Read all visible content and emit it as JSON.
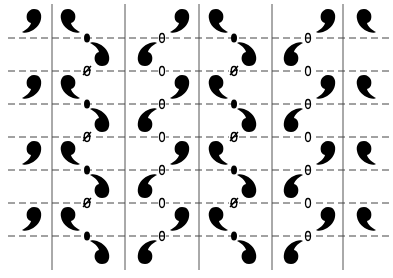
{
  "diagram": {
    "title": "",
    "colors": {
      "background": "#ffffff",
      "motif": "#000000",
      "grid_line": "#555555",
      "dashed_line": "#444444"
    },
    "canvas": {
      "width": 393,
      "height": 278
    },
    "vertical_lines": [
      {
        "x": 52,
        "y1": 4,
        "y2": 270
      },
      {
        "x": 125,
        "y1": 4,
        "y2": 270
      },
      {
        "x": 199,
        "y1": 4,
        "y2": 270
      },
      {
        "x": 272,
        "y1": 4,
        "y2": 270
      },
      {
        "x": 343,
        "y1": 4,
        "y2": 270
      }
    ],
    "dashed_lines": [
      {
        "y": 38
      },
      {
        "y": 71
      },
      {
        "y": 104
      },
      {
        "y": 137
      },
      {
        "y": 170
      },
      {
        "y": 203
      },
      {
        "y": 236
      }
    ],
    "dashed_x_range": [
      8,
      390
    ],
    "band_period": 66,
    "band_offsets": [
      0,
      66,
      132,
      198
    ],
    "motifs_per_band": [
      {
        "name": "motif-col1-upper",
        "type": "comma-head-up-tail-left",
        "x": 34,
        "y": 18,
        "flip": false
      },
      {
        "name": "motif-col2-upper",
        "type": "comma-head-up-tail-right",
        "x": 68,
        "y": 18,
        "flip": true
      },
      {
        "name": "motif-col2-lower",
        "type": "comma-head-down-tail-upleft",
        "x": 102,
        "y": 57,
        "rot": 180,
        "flip": true
      },
      {
        "name": "motif-col3-lower",
        "type": "comma-head-down-tail-upright",
        "x": 145,
        "y": 57,
        "rot": 180,
        "flip": false
      },
      {
        "name": "motif-col3-upper",
        "type": "comma-head-up-tail-left",
        "x": 182,
        "y": 18,
        "flip": false
      },
      {
        "name": "motif-col4-upper",
        "type": "comma-head-up-tail-right",
        "x": 216,
        "y": 18,
        "flip": true
      },
      {
        "name": "motif-col4-lower",
        "type": "comma-head-down-tail-upleft",
        "x": 249,
        "y": 57,
        "rot": 180,
        "flip": true
      },
      {
        "name": "motif-col5-lower",
        "type": "comma-head-down-tail-upright",
        "x": 291,
        "y": 57,
        "rot": 180,
        "flip": false
      },
      {
        "name": "motif-col5-upper",
        "type": "comma-head-up-tail-left",
        "x": 328,
        "y": 18,
        "flip": false
      },
      {
        "name": "motif-col6-upper",
        "type": "comma-head-up-tail-right",
        "x": 364,
        "y": 18,
        "flip": true
      }
    ],
    "symbols_per_band": [
      {
        "name": "twofold-axis-dot",
        "symbol": "filled-ellipse",
        "x": 87,
        "y": 38
      },
      {
        "name": "glide-symbol-slashed",
        "symbol": "Ø",
        "x": 87,
        "y": 71
      },
      {
        "name": "theta-symbol",
        "symbol": "θ",
        "x": 162,
        "y": 38
      },
      {
        "name": "open-ellipse-symbol",
        "symbol": "0",
        "x": 162,
        "y": 71
      },
      {
        "name": "twofold-axis-dot",
        "symbol": "filled-ellipse",
        "x": 234,
        "y": 38
      },
      {
        "name": "glide-symbol-slashed",
        "symbol": "Ø",
        "x": 234,
        "y": 71
      },
      {
        "name": "theta-symbol",
        "symbol": "θ",
        "x": 308,
        "y": 38
      },
      {
        "name": "open-ellipse-symbol",
        "symbol": "0",
        "x": 308,
        "y": 71
      }
    ]
  }
}
